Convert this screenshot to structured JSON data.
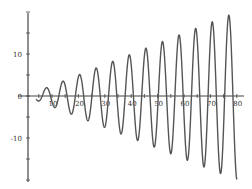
{
  "chart_data": {
    "type": "line",
    "title": "",
    "xlabel": "",
    "ylabel": "",
    "xlim": [
      0,
      80
    ],
    "ylim": [
      -20,
      20
    ],
    "grid": false,
    "legend": null,
    "x_ticks": [
      "10",
      "20",
      "30",
      "40",
      "50",
      "60",
      "70",
      "80"
    ],
    "y_ticks": [
      "10",
      "0",
      "-10"
    ],
    "series": [
      {
        "name": "y = (x/4)·sin(x)",
        "function": "(x/4)*sin(x)",
        "x_range": [
          4,
          80
        ],
        "color": "#555555",
        "approx_peaks": [
          {
            "x": 7.9,
            "y": 2.0
          },
          {
            "x": 14.1,
            "y": 3.5
          },
          {
            "x": 20.4,
            "y": 5.1
          },
          {
            "x": 26.7,
            "y": 6.7
          },
          {
            "x": 33.0,
            "y": 8.2
          },
          {
            "x": 39.3,
            "y": 9.8
          },
          {
            "x": 45.6,
            "y": 11.4
          },
          {
            "x": 51.8,
            "y": 13.0
          },
          {
            "x": 58.1,
            "y": 14.5
          },
          {
            "x": 64.4,
            "y": 16.1
          },
          {
            "x": 70.7,
            "y": 17.7
          },
          {
            "x": 77.0,
            "y": 19.2
          }
        ],
        "approx_troughs": [
          {
            "x": 11.0,
            "y": -2.7
          },
          {
            "x": 17.3,
            "y": -4.3
          },
          {
            "x": 23.6,
            "y": -5.9
          },
          {
            "x": 29.8,
            "y": -7.5
          },
          {
            "x": 36.1,
            "y": -9.0
          },
          {
            "x": 42.4,
            "y": -10.6
          },
          {
            "x": 48.7,
            "y": -12.2
          },
          {
            "x": 55.0,
            "y": -13.7
          },
          {
            "x": 61.3,
            "y": -15.3
          },
          {
            "x": 67.5,
            "y": -16.9
          },
          {
            "x": 73.8,
            "y": -18.5
          }
        ]
      }
    ]
  },
  "axes": {
    "x_origin_px": 25.6,
    "x_scale_px": 2.64,
    "y_origin_px": 96,
    "y_scale_px": 4.2
  }
}
